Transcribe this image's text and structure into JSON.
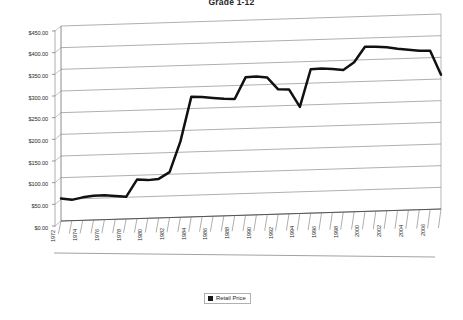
{
  "chart_data": {
    "type": "line",
    "title": "Grade 1-12",
    "xlabel": "",
    "ylabel": "",
    "ylim": [
      0,
      450
    ],
    "ytick_step": 50,
    "grid": true,
    "legend_position": "bottom",
    "y_tick_labels": [
      "$450.00",
      "$400.00",
      "$350.00",
      "$300.00",
      "$250.00",
      "$200.00",
      "$150.00",
      "$100.00",
      "$50.00",
      "$0.00"
    ],
    "y_tick_values": [
      450,
      400,
      350,
      300,
      250,
      200,
      150,
      100,
      50,
      0
    ],
    "x_tick_labels": [
      "1972",
      "1974",
      "1976",
      "1978",
      "1980",
      "1982",
      "1984",
      "1986",
      "1988",
      "1990",
      "1992",
      "1994",
      "1996",
      "1998",
      "2000",
      "2002",
      "2004",
      "2006"
    ],
    "x_label_interval": 2,
    "series": [
      {
        "name": "Retail Price",
        "color": "#111111",
        "x": [
          1972,
          1973,
          1974,
          1975,
          1976,
          1977,
          1978,
          1979,
          1980,
          1981,
          1982,
          1983,
          1984,
          1985,
          1986,
          1987,
          1988,
          1989,
          1990,
          1991,
          1992,
          1993,
          1994,
          1995,
          1996,
          1997,
          1998,
          1999,
          2000,
          2001,
          2002,
          2003,
          2004,
          2005,
          2006,
          2007
        ],
        "values": [
          52,
          48,
          53,
          56,
          56,
          54,
          51,
          90,
          88,
          90,
          105,
          175,
          277,
          276,
          273,
          270,
          269,
          318,
          319,
          316,
          288,
          287,
          246,
          332,
          333,
          331,
          328,
          345,
          380,
          379,
          377,
          373,
          370,
          367,
          366,
          310
        ]
      }
    ]
  },
  "legend": {
    "items": [
      {
        "label": "Retail Price",
        "swatch_color": "#1a1a1a"
      }
    ]
  },
  "axes": {
    "y_axis_name": "price-axis",
    "x_axis_name": "year-axis"
  }
}
